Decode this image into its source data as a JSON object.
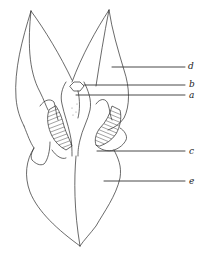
{
  "figure": {
    "type": "botanical line drawing (flower dissection, front view)",
    "labels": [
      {
        "id": "d",
        "text": "d"
      },
      {
        "id": "b",
        "text": "b"
      },
      {
        "id": "a",
        "text": "a"
      },
      {
        "id": "c",
        "text": "c"
      },
      {
        "id": "e",
        "text": "e"
      }
    ],
    "colors": {
      "background": "#ffffff",
      "ink": "#2a2a2a"
    }
  }
}
